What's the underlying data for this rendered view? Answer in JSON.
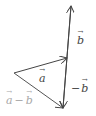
{
  "diagram": {
    "colors": {
      "stroke": "#444444",
      "label_dark": "#444444",
      "label_light": "#a8a8a8",
      "background": "#ffffff"
    },
    "vectors": [
      {
        "name": "b",
        "label": "b",
        "from": [
          63,
          108
        ],
        "to": [
          71,
          6
        ]
      },
      {
        "name": "a",
        "label": "a",
        "from": [
          14,
          73
        ],
        "to": [
          67,
          58
        ]
      },
      {
        "name": "neg_b",
        "label": "-b",
        "from": [
          71,
          6
        ],
        "to": [
          63,
          108
        ]
      },
      {
        "name": "a_minus_b",
        "label": "a - b",
        "from": [
          14,
          73
        ],
        "to": [
          63,
          108
        ]
      }
    ],
    "labels": {
      "b": "b",
      "a": "a",
      "neg_sign": "−",
      "neg_b": "b",
      "diff_a": "a",
      "diff_op": "−",
      "diff_b": "b"
    }
  }
}
